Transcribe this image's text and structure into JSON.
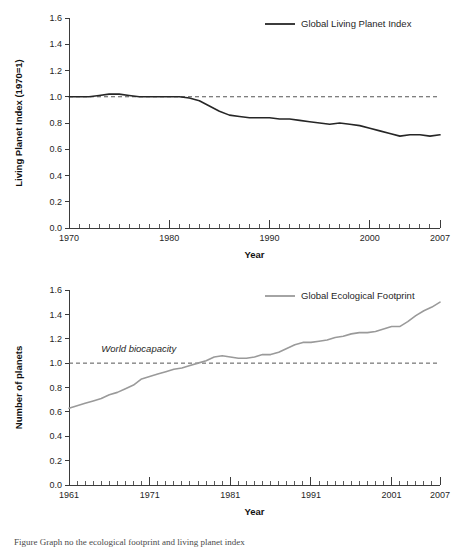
{
  "figure": {
    "caption": "Figure  Graph  no  the  ecological  footprint  and  living  planet  index"
  },
  "chart_data": [
    {
      "id": "living-planet-index",
      "type": "line",
      "title": "",
      "xlabel": "Year",
      "ylabel": "Living Planet Index (1970=1)",
      "xlim": [
        1970,
        2007
      ],
      "ylim": [
        0.0,
        1.6
      ],
      "grid": false,
      "legend_position": "top-right",
      "y_ticks": [
        "0.0",
        "0.2",
        "0.4",
        "0.6",
        "0.8",
        "1.0",
        "1.2",
        "1.4",
        "1.6"
      ],
      "y_tick_values": [
        0.0,
        0.2,
        0.4,
        0.6,
        0.8,
        1.0,
        1.2,
        1.4,
        1.6
      ],
      "x_ticks": [
        "1970",
        "1980",
        "1990",
        "2000",
        "2007"
      ],
      "x_tick_values": [
        1970,
        1980,
        1990,
        2000,
        2007
      ],
      "x_minor_step": 1,
      "reference_line": {
        "value": 1.0,
        "style": "dashed",
        "color": "#555555"
      },
      "series": [
        {
          "name": "Global Living Planet Index",
          "color": "#262626",
          "x": [
            1970,
            1971,
            1972,
            1973,
            1974,
            1975,
            1976,
            1977,
            1978,
            1979,
            1980,
            1981,
            1982,
            1983,
            1984,
            1985,
            1986,
            1987,
            1988,
            1989,
            1990,
            1991,
            1992,
            1993,
            1994,
            1995,
            1996,
            1997,
            1998,
            1999,
            2000,
            2001,
            2002,
            2003,
            2004,
            2005,
            2006,
            2007
          ],
          "values": [
            1.0,
            1.0,
            1.0,
            1.01,
            1.02,
            1.02,
            1.01,
            1.0,
            1.0,
            1.0,
            1.0,
            1.0,
            0.99,
            0.97,
            0.93,
            0.89,
            0.86,
            0.85,
            0.84,
            0.84,
            0.84,
            0.83,
            0.83,
            0.82,
            0.81,
            0.8,
            0.79,
            0.8,
            0.79,
            0.78,
            0.76,
            0.74,
            0.72,
            0.7,
            0.71,
            0.71,
            0.7,
            0.71
          ]
        }
      ]
    },
    {
      "id": "global-ecological-footprint",
      "type": "line",
      "title": "",
      "xlabel": "Year",
      "ylabel": "Number of planets",
      "xlim": [
        1961,
        2007
      ],
      "ylim": [
        0.0,
        1.6
      ],
      "grid": false,
      "legend_position": "top-right",
      "y_ticks": [
        "0.0",
        "0.2",
        "0.4",
        "0.6",
        "0.8",
        "1.0",
        "1.2",
        "1.4",
        "1.6"
      ],
      "y_tick_values": [
        0.0,
        0.2,
        0.4,
        0.6,
        0.8,
        1.0,
        1.2,
        1.4,
        1.6
      ],
      "x_ticks": [
        "1961",
        "1971",
        "1981",
        "1991",
        "2001",
        "2007"
      ],
      "x_tick_values": [
        1961,
        1971,
        1981,
        1991,
        2001,
        2007
      ],
      "x_minor_step": 1,
      "reference_line": {
        "value": 1.0,
        "style": "dashed",
        "color": "#555555",
        "label": "World biocapacity"
      },
      "annotations": [
        {
          "text": "World biocapacity",
          "x": 1965,
          "y": 1.09,
          "style": "italic"
        }
      ],
      "series": [
        {
          "name": "Global Ecological Footprint",
          "color": "#9a9a9a",
          "x": [
            1961,
            1962,
            1963,
            1964,
            1965,
            1966,
            1967,
            1968,
            1969,
            1970,
            1971,
            1972,
            1973,
            1974,
            1975,
            1976,
            1977,
            1978,
            1979,
            1980,
            1981,
            1982,
            1983,
            1984,
            1985,
            1986,
            1987,
            1988,
            1989,
            1990,
            1991,
            1992,
            1993,
            1994,
            1995,
            1996,
            1997,
            1998,
            1999,
            2000,
            2001,
            2002,
            2003,
            2004,
            2005,
            2006,
            2007
          ],
          "values": [
            0.63,
            0.65,
            0.67,
            0.69,
            0.71,
            0.74,
            0.76,
            0.79,
            0.82,
            0.87,
            0.89,
            0.91,
            0.93,
            0.95,
            0.96,
            0.98,
            1.0,
            1.02,
            1.05,
            1.06,
            1.05,
            1.04,
            1.04,
            1.05,
            1.07,
            1.07,
            1.09,
            1.12,
            1.15,
            1.17,
            1.17,
            1.18,
            1.19,
            1.21,
            1.22,
            1.24,
            1.25,
            1.25,
            1.26,
            1.28,
            1.3,
            1.3,
            1.34,
            1.39,
            1.43,
            1.46,
            1.5
          ]
        }
      ]
    }
  ]
}
